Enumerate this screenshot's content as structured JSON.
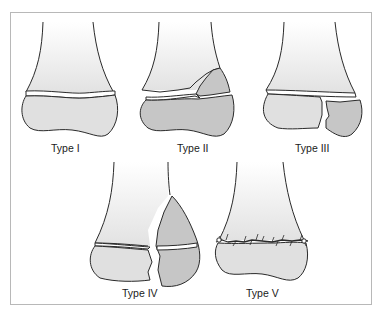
{
  "figure": {
    "panels": [
      {
        "id": "type1",
        "label": "Type I"
      },
      {
        "id": "type2",
        "label": "Type II"
      },
      {
        "id": "type3",
        "label": "Type III"
      },
      {
        "id": "type4",
        "label": "Type IV"
      },
      {
        "id": "type5",
        "label": "Type V"
      }
    ],
    "colors": {
      "outline": "#2a2a2a",
      "shaft_top": "#ffffff",
      "shaft_bottom": "#e4e4e4",
      "epiphysis": "#e0e0e0",
      "fragment": "#c6c6c6",
      "frame": "#b8b8b8"
    }
  }
}
